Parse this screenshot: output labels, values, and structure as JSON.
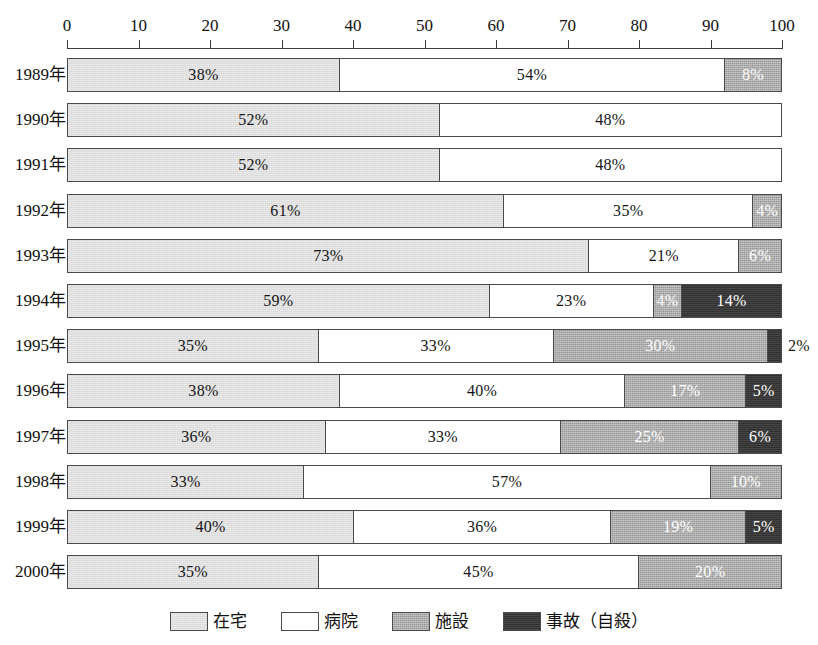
{
  "chart_data": {
    "type": "bar",
    "orientation": "horizontal",
    "stacked": true,
    "normalized_percent": true,
    "title": "",
    "subtitle": "",
    "xlabel": "",
    "ylabel": "",
    "xlim": [
      0,
      100
    ],
    "xticks": [
      0,
      10,
      20,
      30,
      40,
      50,
      60,
      70,
      80,
      90,
      100
    ],
    "xtick_labels": [
      "0",
      "10",
      "20",
      "30",
      "40",
      "50",
      "60",
      "70",
      "80",
      "90",
      "100"
    ],
    "grid": false,
    "legend_position": "bottom",
    "categories": [
      "1989年",
      "1990年",
      "1991年",
      "1992年",
      "1993年",
      "1994年",
      "1995年",
      "1996年",
      "1997年",
      "1998年",
      "1999年",
      "2000年"
    ],
    "series": [
      {
        "name": "在宅",
        "color": "#d9d9d9",
        "values": [
          38,
          52,
          52,
          61,
          73,
          59,
          35,
          38,
          36,
          33,
          40,
          35
        ]
      },
      {
        "name": "病院",
        "color": "#ffffff",
        "values": [
          54,
          48,
          48,
          35,
          21,
          23,
          33,
          40,
          33,
          57,
          36,
          45
        ]
      },
      {
        "name": "施設",
        "color": "#969696",
        "values": [
          8,
          0,
          0,
          4,
          6,
          4,
          30,
          17,
          25,
          10,
          19,
          20
        ]
      },
      {
        "name": "事故（自殺）",
        "color": "#313131",
        "values": [
          0,
          0,
          0,
          0,
          0,
          14,
          2,
          5,
          6,
          0,
          5,
          0
        ]
      }
    ],
    "data_labels": [
      {
        "category": "1989年",
        "labels": [
          {
            "series": "在宅",
            "text": "38%",
            "value": 38,
            "placement": "inside"
          },
          {
            "series": "病院",
            "text": "54%",
            "value": 54,
            "placement": "inside"
          },
          {
            "series": "施設",
            "text": "8%",
            "value": 8,
            "placement": "inside"
          }
        ]
      },
      {
        "category": "1990年",
        "labels": [
          {
            "series": "在宅",
            "text": "52%",
            "value": 52,
            "placement": "inside"
          },
          {
            "series": "病院",
            "text": "48%",
            "value": 48,
            "placement": "inside"
          }
        ]
      },
      {
        "category": "1991年",
        "labels": [
          {
            "series": "在宅",
            "text": "52%",
            "value": 52,
            "placement": "inside"
          },
          {
            "series": "病院",
            "text": "48%",
            "value": 48,
            "placement": "inside"
          }
        ]
      },
      {
        "category": "1992年",
        "labels": [
          {
            "series": "在宅",
            "text": "61%",
            "value": 61,
            "placement": "inside"
          },
          {
            "series": "病院",
            "text": "35%",
            "value": 35,
            "placement": "inside"
          },
          {
            "series": "施設",
            "text": "4%",
            "value": 4,
            "placement": "inside"
          }
        ]
      },
      {
        "category": "1993年",
        "labels": [
          {
            "series": "在宅",
            "text": "73%",
            "value": 73,
            "placement": "inside"
          },
          {
            "series": "病院",
            "text": "21%",
            "value": 21,
            "placement": "inside"
          },
          {
            "series": "施設",
            "text": "6%",
            "value": 6,
            "placement": "inside"
          }
        ]
      },
      {
        "category": "1994年",
        "labels": [
          {
            "series": "在宅",
            "text": "59%",
            "value": 59,
            "placement": "inside"
          },
          {
            "series": "病院",
            "text": "23%",
            "value": 23,
            "placement": "inside"
          },
          {
            "series": "施設",
            "text": "4%",
            "value": 4,
            "placement": "inside"
          },
          {
            "series": "事故（自殺）",
            "text": "14%",
            "value": 14,
            "placement": "inside"
          }
        ]
      },
      {
        "category": "1995年",
        "labels": [
          {
            "series": "在宅",
            "text": "35%",
            "value": 35,
            "placement": "inside"
          },
          {
            "series": "病院",
            "text": "33%",
            "value": 33,
            "placement": "inside"
          },
          {
            "series": "施設",
            "text": "30%",
            "value": 30,
            "placement": "inside"
          },
          {
            "series": "事故（自殺）",
            "text": "2%",
            "value": 2,
            "placement": "outside"
          }
        ]
      },
      {
        "category": "1996年",
        "labels": [
          {
            "series": "在宅",
            "text": "38%",
            "value": 38,
            "placement": "inside"
          },
          {
            "series": "病院",
            "text": "40%",
            "value": 40,
            "placement": "inside"
          },
          {
            "series": "施設",
            "text": "17%",
            "value": 17,
            "placement": "inside"
          },
          {
            "series": "事故（自殺）",
            "text": "5%",
            "value": 5,
            "placement": "inside"
          }
        ]
      },
      {
        "category": "1997年",
        "labels": [
          {
            "series": "在宅",
            "text": "36%",
            "value": 36,
            "placement": "inside"
          },
          {
            "series": "病院",
            "text": "33%",
            "value": 33,
            "placement": "inside"
          },
          {
            "series": "施設",
            "text": "25%",
            "value": 25,
            "placement": "inside"
          },
          {
            "series": "事故（自殺）",
            "text": "6%",
            "value": 6,
            "placement": "inside"
          }
        ]
      },
      {
        "category": "1998年",
        "labels": [
          {
            "series": "在宅",
            "text": "33%",
            "value": 33,
            "placement": "inside"
          },
          {
            "series": "病院",
            "text": "57%",
            "value": 57,
            "placement": "inside"
          },
          {
            "series": "施設",
            "text": "10%",
            "value": 10,
            "placement": "inside"
          }
        ]
      },
      {
        "category": "1999年",
        "labels": [
          {
            "series": "在宅",
            "text": "40%",
            "value": 40,
            "placement": "inside"
          },
          {
            "series": "病院",
            "text": "36%",
            "value": 36,
            "placement": "inside"
          },
          {
            "series": "施設",
            "text": "19%",
            "value": 19,
            "placement": "inside"
          },
          {
            "series": "事故（自殺）",
            "text": "5%",
            "value": 5,
            "placement": "inside"
          }
        ]
      },
      {
        "category": "2000年",
        "labels": [
          {
            "series": "在宅",
            "text": "35%",
            "value": 35,
            "placement": "inside"
          },
          {
            "series": "病院",
            "text": "45%",
            "value": 45,
            "placement": "inside"
          },
          {
            "series": "施設",
            "text": "20%",
            "value": 20,
            "placement": "inside"
          }
        ]
      }
    ],
    "legend": [
      {
        "label": "在宅",
        "color": "#d9d9d9"
      },
      {
        "label": "病院",
        "color": "#ffffff"
      },
      {
        "label": "施設",
        "color": "#969696"
      },
      {
        "label": "事故（自殺）",
        "color": "#313131"
      }
    ]
  },
  "colors": {
    "home": "#d9d9d9",
    "hospital": "#ffffff",
    "facility": "#969696",
    "accident": "#313131",
    "outline": "#4a4a4a",
    "axis": "#3a3a3a",
    "text": "#111111",
    "background": "#ffffff"
  }
}
